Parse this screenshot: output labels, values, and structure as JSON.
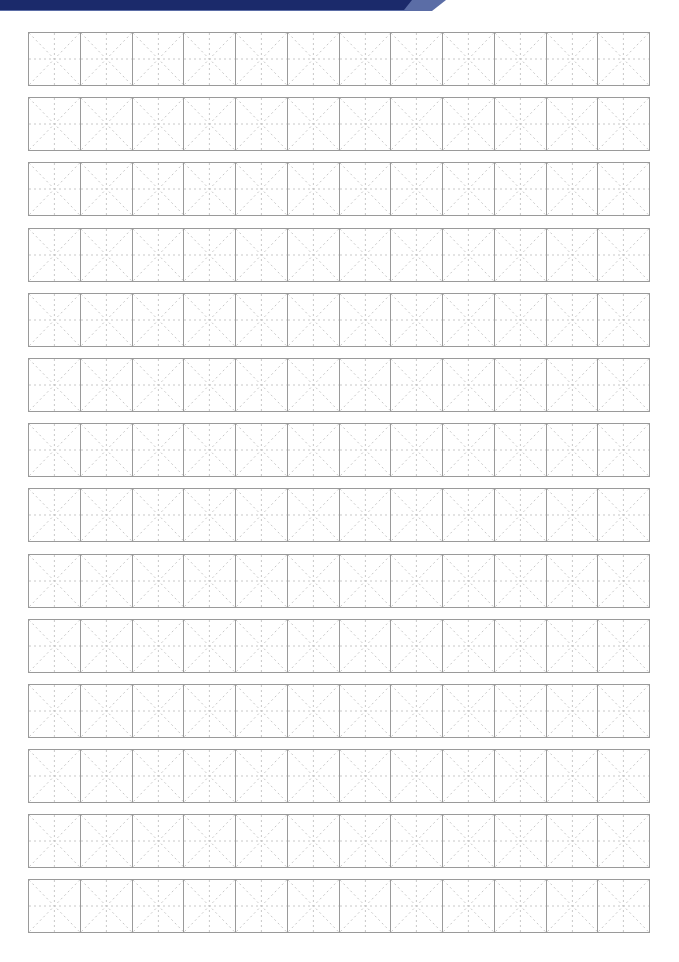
{
  "page": {
    "type": "mi-zi-ge practice sheet",
    "header": {
      "text": "",
      "band_color": "#1b2a6b",
      "tip_color": "#5b6da6"
    },
    "grid": {
      "rows": 14,
      "columns": 12,
      "cell_style": "mi-zi-ge",
      "border_color": "#9a9a9a",
      "guide_color": "#c8c8c8"
    }
  }
}
